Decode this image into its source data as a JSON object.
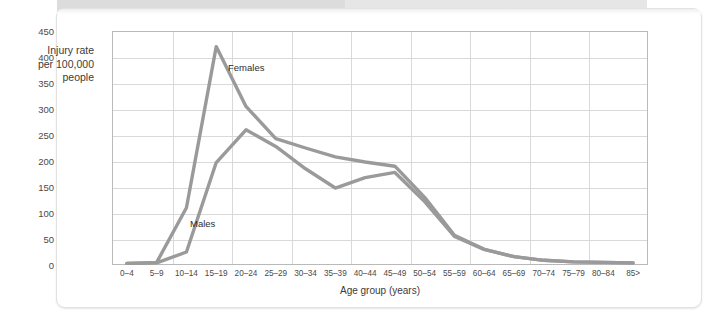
{
  "figure": {
    "y_axis_label": [
      "Injury rate",
      "per 100,000",
      "people"
    ],
    "x_axis_label": "Age group (years)",
    "line_color": "#9a9a9a",
    "grid_color": "#d9d9d9",
    "axis_color": "#b9b9b9"
  },
  "chart_data": {
    "type": "line",
    "title": "",
    "xlabel": "Age group (years)",
    "ylabel": "Injury rate per 100,000 people",
    "ylim": [
      0,
      450
    ],
    "yticks": [
      0,
      50,
      100,
      150,
      200,
      250,
      300,
      350,
      400,
      450
    ],
    "grid": true,
    "legend": "inline-annotation",
    "categories": [
      "0–4",
      "5–9",
      "10–14",
      "15–19",
      "20–24",
      "25–29",
      "30–34",
      "35–39",
      "40–44",
      "45–49",
      "50–54",
      "55–59",
      "60–64",
      "65–69",
      "70–74",
      "75–79",
      "80–84",
      "85>"
    ],
    "series": [
      {
        "name": "Females",
        "values": [
          3,
          5,
          110,
          420,
          305,
          243,
          225,
          208,
          198,
          190,
          130,
          57,
          30,
          16,
          9,
          6,
          5,
          4
        ]
      },
      {
        "name": "Males",
        "values": [
          3,
          4,
          25,
          197,
          260,
          228,
          185,
          148,
          168,
          178,
          122,
          55,
          30,
          16,
          9,
          6,
          5,
          4
        ]
      }
    ],
    "annotations": [
      {
        "text": "Females",
        "category": "20–24",
        "value": 380
      },
      {
        "text": "Males",
        "category": "15–19",
        "value": 88
      }
    ]
  }
}
